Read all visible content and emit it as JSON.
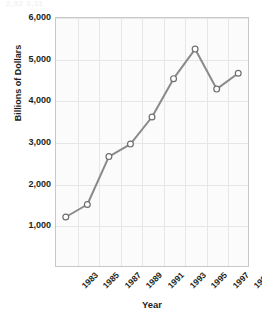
{
  "ghost_header": "2,52   2,11",
  "chart_data": {
    "type": "line",
    "title": "",
    "xlabel": "Year",
    "ylabel": "Billions of Dollars",
    "categories": [
      "1983",
      "1985",
      "1987",
      "1989",
      "1991",
      "1993",
      "1995",
      "1997",
      "1999"
    ],
    "values": [
      1200,
      1500,
      2650,
      2950,
      3600,
      4520,
      5230,
      4270,
      4650
    ],
    "series": [
      {
        "name": "Billions of Dollars",
        "values": [
          1200,
          1500,
          2650,
          2950,
          3600,
          4520,
          5230,
          4270,
          4650
        ]
      }
    ],
    "ylim": [
      0,
      6000
    ],
    "ytick_labels": [
      "6,000",
      "5,000",
      "4,000",
      "3,000",
      "2,000",
      "1,000"
    ],
    "ytick_values": [
      6000,
      5000,
      4000,
      3000,
      2000,
      1000
    ],
    "xlim_categories": 9,
    "grid": true,
    "legend": "none",
    "colors": {
      "line": "#8a8a8a",
      "marker_fill": "#ffffff",
      "marker_stroke": "#6e6e6e",
      "grid": "#e6e6e6",
      "frame": "#c8c8c8",
      "plot_background": "#fbfbfb",
      "text": "#231f20"
    }
  }
}
